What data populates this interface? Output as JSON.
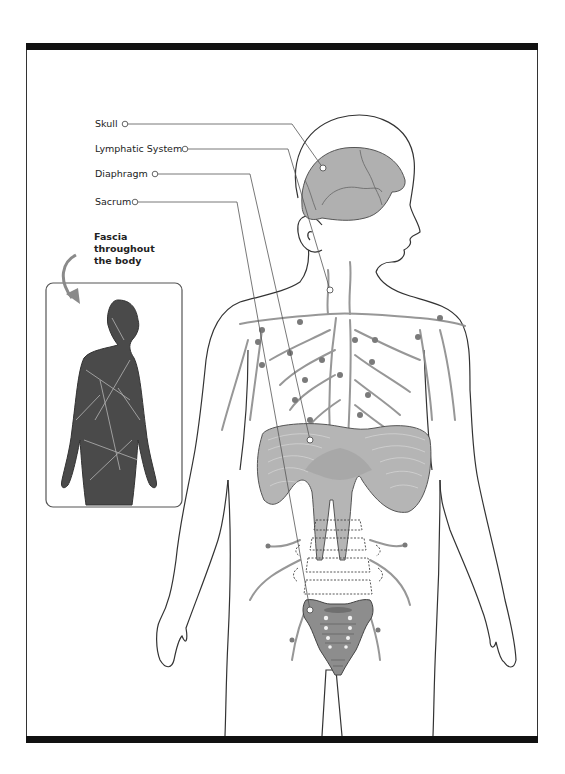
{
  "diagram": {
    "labels": [
      {
        "id": "skull",
        "text": "Skull"
      },
      {
        "id": "lymphatic",
        "text": "Lymphatic System"
      },
      {
        "id": "diaphragm",
        "text": "Diaphragm"
      },
      {
        "id": "sacrum",
        "text": "Sacrum"
      }
    ],
    "inset": {
      "caption": "Fascia throughout the body",
      "caption_lines": [
        "Fascia",
        "throughout",
        "the body"
      ]
    },
    "colors": {
      "organ_fill": "#a9a9a9",
      "organ_stroke": "#555555",
      "lymph": "#8c8c8c",
      "outline": "#333333",
      "fascia_body": "#4a4a4a",
      "frame_bar": "#111111"
    }
  }
}
